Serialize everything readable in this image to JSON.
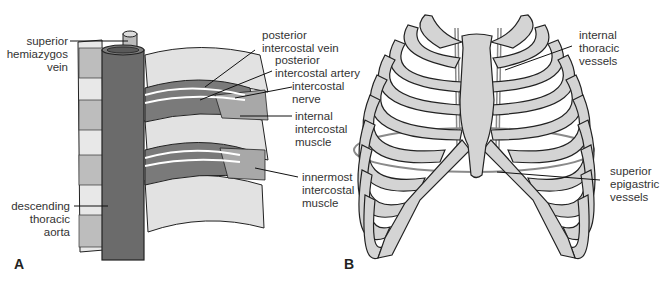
{
  "figure": {
    "panel_a": {
      "letter": "A",
      "labels": {
        "superior_hemiazygos_vein": [
          "superior",
          "hemiazygos",
          "vein"
        ],
        "posterior_intercostal_vein": [
          "posterior",
          "intercostal vein"
        ],
        "posterior_intercostal_artery": [
          "posterior",
          "intercostal artery"
        ],
        "intercostal_nerve": [
          "intercostal",
          "nerve"
        ],
        "internal_intercostal_muscle": [
          "internal",
          "intercostal",
          "muscle"
        ],
        "innermost_intercostal_muscle": [
          "innermost",
          "intercostal",
          "muscle"
        ],
        "descending_thoracic_aorta": [
          "descending",
          "thoracic",
          "aorta"
        ]
      }
    },
    "panel_b": {
      "letter": "B",
      "labels": {
        "internal_thoracic_vessels": [
          "internal",
          "thoracic",
          "vessels"
        ],
        "superior_epigastric_vessels": [
          "superior",
          "epigastric",
          "vessels"
        ]
      }
    },
    "colors": {
      "aorta": "#6b6b6b",
      "bone": "#d4d4d4",
      "muscle_band": "#cfcfcf",
      "outline": "#1e1e1e",
      "vessel": "#888888",
      "diaphragm": "#8a8a8a"
    }
  }
}
